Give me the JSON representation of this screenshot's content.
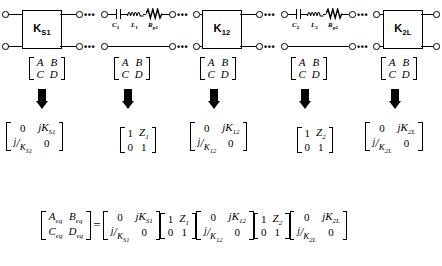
{
  "figure": {
    "caption": ""
  },
  "circuit": {
    "boxes": [
      {
        "name": "K_S1",
        "label": "K",
        "sub": "S1",
        "x": 22,
        "y": 10,
        "w": 38,
        "h": 37
      },
      {
        "name": "K_12",
        "label": "K",
        "sub": "12",
        "x": 202,
        "y": 10,
        "w": 38,
        "h": 37
      },
      {
        "name": "K_2L",
        "label": "K",
        "sub": "2L",
        "x": 383,
        "y": 10,
        "w": 38,
        "h": 37
      }
    ],
    "resonators": [
      {
        "name": "resonator-1",
        "capacitor": "C",
        "capacitor_sub": "1",
        "inductor": "L",
        "inductor_sub": "1",
        "resistor": "R",
        "resistor_sub": "p1"
      },
      {
        "name": "resonator-2",
        "capacitor": "C",
        "capacitor_sub": "2",
        "inductor": "L",
        "inductor_sub": "2",
        "resistor": "R",
        "resistor_sub": "p2"
      }
    ],
    "ellipsis": "•••"
  },
  "abcd": {
    "label_A": "A",
    "label_B": "B",
    "label_C": "C",
    "label_D": "D",
    "count": 5
  },
  "matrices": [
    {
      "name": "matrix-K-S1",
      "kind": "coupling",
      "r0c0": "0",
      "r0c1": {
        "pre": "j",
        "sym": "K",
        "sub": "S1"
      },
      "r1c0": {
        "num": "j",
        "den_sym": "K",
        "den_sub": "S1"
      },
      "r1c1": "0"
    },
    {
      "name": "matrix-Z1",
      "kind": "series",
      "r0c0": "1",
      "r0c1": {
        "sym": "Z",
        "sub": "1"
      },
      "r1c0": "0",
      "r1c1": "1"
    },
    {
      "name": "matrix-K-12",
      "kind": "coupling",
      "r0c0": "0",
      "r0c1": {
        "pre": "j",
        "sym": "K",
        "sub": "12"
      },
      "r1c0": {
        "num": "j",
        "den_sym": "K",
        "den_sub": "12"
      },
      "r1c1": "0"
    },
    {
      "name": "matrix-Z2",
      "kind": "series",
      "r0c0": "1",
      "r0c1": {
        "sym": "Z",
        "sub": "2"
      },
      "r1c0": "0",
      "r1c1": "1"
    },
    {
      "name": "matrix-K-2L",
      "kind": "coupling",
      "r0c0": "0",
      "r0c1": {
        "pre": "j",
        "sym": "K",
        "sub": "2L"
      },
      "r1c0": {
        "num": "j",
        "den_sym": "K",
        "den_sub": "2L"
      },
      "r1c1": "0"
    }
  ],
  "equation": {
    "lhs": {
      "r0c0": {
        "sym": "A",
        "sub": "eq"
      },
      "r0c1": {
        "sym": "B",
        "sub": "eq"
      },
      "r1c0": {
        "sym": "C",
        "sub": "eq"
      },
      "r1c1": {
        "sym": "D",
        "sub": "eq"
      }
    },
    "equals": "=",
    "factors": [
      {
        "name": "eq-matrix-K-S1",
        "r0c0": "0",
        "r0c1": {
          "pre": "j",
          "sym": "K",
          "sub": "S1"
        },
        "r1c0": {
          "num": "j",
          "den_sym": "K",
          "den_sub": "S1"
        },
        "r1c1": "0"
      },
      {
        "name": "eq-matrix-Z1",
        "r0c0": "1",
        "r0c1": {
          "sym": "Z",
          "sub": "1"
        },
        "r1c0": "0",
        "r1c1": "1"
      },
      {
        "name": "eq-matrix-K-12",
        "r0c0": "0",
        "r0c1": {
          "pre": "j",
          "sym": "K",
          "sub": "12"
        },
        "r1c0": {
          "num": "j",
          "den_sym": "K",
          "den_sub": "12"
        },
        "r1c1": "0"
      },
      {
        "name": "eq-matrix-Z2",
        "r0c0": "1",
        "r0c1": {
          "sym": "Z",
          "sub": "2"
        },
        "r1c0": "0",
        "r1c1": "1"
      },
      {
        "name": "eq-matrix-K-2L",
        "r0c0": "0",
        "r0c1": {
          "pre": "j",
          "sym": "K",
          "sub": "2L"
        },
        "r1c0": {
          "num": "j",
          "den_sym": "K",
          "den_sub": "2L"
        },
        "r1c1": "0"
      }
    ]
  }
}
